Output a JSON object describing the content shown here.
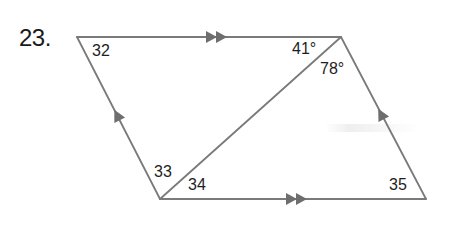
{
  "problem": {
    "number": "23."
  },
  "figure": {
    "type": "parallelogram-with-diagonal",
    "stroke_color": "#7a7a7a",
    "vertices": {
      "top_left": [
        77,
        37
      ],
      "top_right": [
        341,
        37
      ],
      "bottom_left": [
        160,
        199
      ],
      "bottom_right": [
        426,
        199
      ]
    },
    "parallel_marks": {
      "horizontal_sides": "double-arrow",
      "slanted_sides": "single-arrow"
    },
    "diagonal": "bottom_left-to-top_right"
  },
  "angles": [
    {
      "id": "angle-32",
      "label": "32",
      "vertex": "top_left"
    },
    {
      "id": "angle-41",
      "label": "41°",
      "vertex": "top_right",
      "measure_deg": 41
    },
    {
      "id": "angle-78",
      "label": "78°",
      "vertex": "top_right",
      "measure_deg": 78
    },
    {
      "id": "angle-33",
      "label": "33",
      "vertex": "bottom_left"
    },
    {
      "id": "angle-34",
      "label": "34",
      "vertex": "bottom_left"
    },
    {
      "id": "angle-35",
      "label": "35",
      "vertex": "bottom_right"
    }
  ]
}
